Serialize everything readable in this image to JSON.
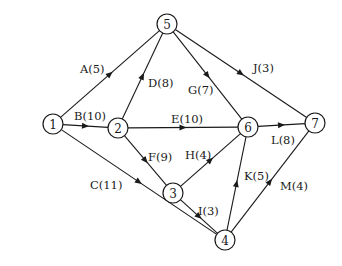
{
  "diagram": {
    "type": "activity-on-arrow network",
    "nodes": [
      {
        "id": "1",
        "label": "1",
        "x": 53,
        "y": 124
      },
      {
        "id": "2",
        "label": "2",
        "x": 118,
        "y": 128
      },
      {
        "id": "3",
        "label": "3",
        "x": 173,
        "y": 193
      },
      {
        "id": "4",
        "label": "4",
        "x": 225,
        "y": 240
      },
      {
        "id": "5",
        "label": "5",
        "x": 167,
        "y": 24
      },
      {
        "id": "6",
        "label": "6",
        "x": 248,
        "y": 127
      },
      {
        "id": "7",
        "label": "7",
        "x": 315,
        "y": 123
      }
    ],
    "edges": [
      {
        "id": "A",
        "from": "1",
        "to": "5",
        "label": "A(5)",
        "activity": "A",
        "duration": 5,
        "label_x": 80,
        "label_y": 73,
        "anchor": "start"
      },
      {
        "id": "B",
        "from": "1",
        "to": "2",
        "label": "B(10)",
        "activity": "B",
        "duration": 10,
        "label_x": 74,
        "label_y": 120,
        "anchor": "start"
      },
      {
        "id": "C",
        "from": "1",
        "to": "4",
        "label": "C(11)",
        "activity": "C",
        "duration": 11,
        "label_x": 90,
        "label_y": 189,
        "anchor": "start"
      },
      {
        "id": "D",
        "from": "2",
        "to": "5",
        "label": "D(8)",
        "activity": "D",
        "duration": 8,
        "label_x": 148,
        "label_y": 87,
        "anchor": "start"
      },
      {
        "id": "E",
        "from": "2",
        "to": "6",
        "label": "E(10)",
        "activity": "E",
        "duration": 10,
        "label_x": 171,
        "label_y": 123,
        "anchor": "start"
      },
      {
        "id": "F",
        "from": "2",
        "to": "3",
        "label": "F(9)",
        "activity": "F",
        "duration": 9,
        "label_x": 148,
        "label_y": 161,
        "anchor": "start"
      },
      {
        "id": "G",
        "from": "5",
        "to": "6",
        "label": "G(7)",
        "activity": "G",
        "duration": 7,
        "label_x": 188,
        "label_y": 94,
        "anchor": "start"
      },
      {
        "id": "H",
        "from": "3",
        "to": "6",
        "label": "H(4)",
        "activity": "H",
        "duration": 4,
        "label_x": 185,
        "label_y": 159,
        "anchor": "start"
      },
      {
        "id": "I",
        "from": "3",
        "to": "4",
        "label": "I(3)",
        "activity": "I",
        "duration": 3,
        "label_x": 198,
        "label_y": 215,
        "anchor": "start"
      },
      {
        "id": "J",
        "from": "5",
        "to": "7",
        "label": "J(3)",
        "activity": "J",
        "duration": 3,
        "label_x": 253,
        "label_y": 72,
        "anchor": "start"
      },
      {
        "id": "K",
        "from": "4",
        "to": "6",
        "label": "K(5)",
        "activity": "K",
        "duration": 5,
        "label_x": 244,
        "label_y": 180,
        "anchor": "start"
      },
      {
        "id": "L",
        "from": "6",
        "to": "7",
        "label": "L(8)",
        "activity": "L",
        "duration": 8,
        "label_x": 271,
        "label_y": 144,
        "anchor": "start"
      },
      {
        "id": "M",
        "from": "4",
        "to": "7",
        "label": "M(4)",
        "activity": "M",
        "duration": 4,
        "label_x": 280,
        "label_y": 190,
        "anchor": "start"
      }
    ],
    "node_radius": 10,
    "colors": {
      "stroke": "#1a1a1a",
      "background": "#ffffff"
    }
  }
}
